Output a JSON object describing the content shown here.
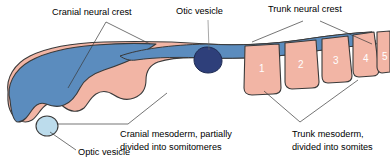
{
  "figure": {
    "colors": {
      "neural_crest_blue": "#5b8cbe",
      "mesoderm_pink": "#f2b5a5",
      "otic_vesicle_navy": "#2e3f7a",
      "optic_vesicle_pale": "#bcdcec",
      "outline": "#3a3a3a",
      "label": "#000000",
      "somite_number": "#ffffff",
      "background": "#ffffff"
    },
    "labels": {
      "cranial_neural_crest": "Cranial neural crest",
      "otic_vesicle": "Otic vesicle",
      "trunk_neural_crest": "Trunk neural crest",
      "optic_vesicle": "Optic vesicle",
      "cranial_mesoderm_line1": "Cranial mesoderm, partially",
      "cranial_mesoderm_line2": "divided into somitomeres",
      "trunk_mesoderm_line1": "Trunk mesoderm,",
      "trunk_mesoderm_line2": "divided into somites"
    },
    "somites": [
      {
        "number": "1"
      },
      {
        "number": "2"
      },
      {
        "number": "3"
      },
      {
        "number": "4"
      },
      {
        "number": "5"
      }
    ]
  }
}
